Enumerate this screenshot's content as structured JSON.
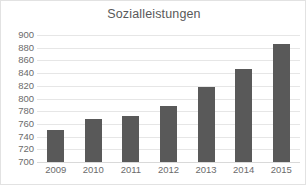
{
  "chart_data": {
    "type": "bar",
    "title": "Sozialleistungen",
    "xlabel": "",
    "ylabel": "",
    "categories": [
      "2009",
      "2010",
      "2011",
      "2012",
      "2013",
      "2014",
      "2015"
    ],
    "values": [
      751,
      768,
      772,
      789,
      818,
      847,
      886
    ],
    "ylim": [
      700,
      900
    ],
    "ytick_step": 20,
    "yticks": [
      900,
      880,
      860,
      840,
      820,
      800,
      780,
      760,
      740,
      720,
      700
    ],
    "ytick_labels": [
      "900",
      "880",
      "860",
      "840",
      "820",
      "800",
      "780",
      "760",
      "740",
      "720",
      "700"
    ],
    "grid": true,
    "legend": false,
    "legend_position": "none",
    "series": [
      {
        "name": "Sozialleistungen",
        "values": [
          751,
          768,
          772,
          789,
          818,
          847,
          886
        ],
        "color": "#595959"
      }
    ],
    "colors": {
      "bar": "#595959",
      "gridline": "#e6e6e6",
      "baseline": "#d9d9d9",
      "title_text": "#595959",
      "tick_text": "#6b6b6b",
      "background": "#ffffff",
      "frame_border": "#e2e2e2"
    }
  }
}
